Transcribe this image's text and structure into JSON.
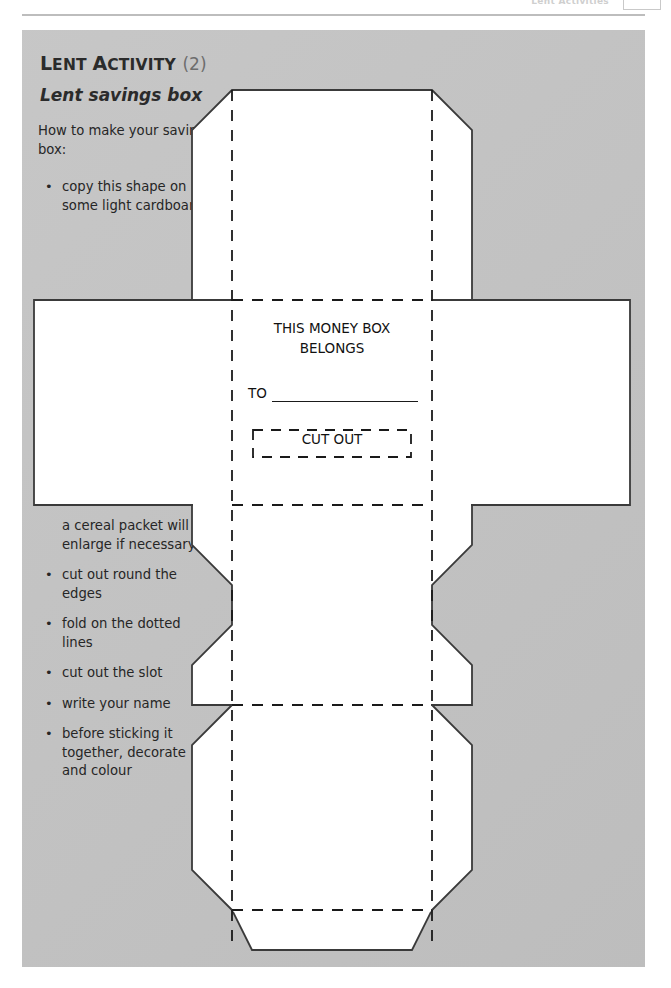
{
  "header": {
    "title": "Lent Activities",
    "page_number": "",
    "page_box_icon": "page-number-box"
  },
  "activity": {
    "title_lead": "L",
    "title_rest": "ENT ",
    "title_word2_lead": "A",
    "title_word2_rest": "CTIVITY",
    "title_full": "Lent Activity",
    "number": "(2)",
    "subtitle": "Lent savings box"
  },
  "instructions": {
    "intro": "How to make your savings box:",
    "top_items": [
      {
        "bullet": "•",
        "text": "copy this shape on some light cardboard:"
      }
    ],
    "bottom_items": [
      {
        "bullet": "",
        "text": "a cereal packet will do, enlarge if necessary"
      },
      {
        "bullet": "•",
        "text": "cut out round the edges"
      },
      {
        "bullet": "•",
        "text": "fold on the dotted lines"
      },
      {
        "bullet": "•",
        "text": "cut out the slot"
      },
      {
        "bullet": "•",
        "text": "write your name"
      },
      {
        "bullet": "•",
        "text": "before sticking it together, decorate and colour"
      }
    ]
  },
  "net_labels": {
    "belongs_line1": "THIS MONEY BOX",
    "belongs_line2": "BELONGS",
    "to": "TO",
    "cut_out": "CUT OUT"
  },
  "colors": {
    "panel_grey": "#c4c4c4",
    "card_white": "#ffffff",
    "ink": "#1a1a1a",
    "title_ink": "#2b2b2b",
    "number_grey": "#6d6d6d",
    "rule_grey": "#bdbdbd",
    "header_faint": "#cfcfcf"
  }
}
